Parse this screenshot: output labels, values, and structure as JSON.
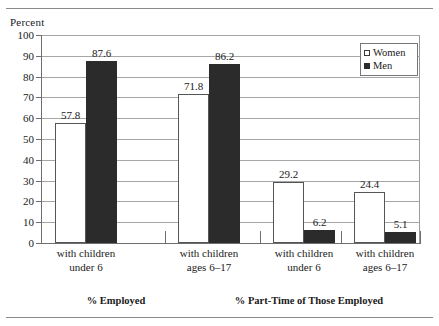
{
  "figure": {
    "axis_unit_label": "Percent",
    "rule_top": "horizontal-rule",
    "rule_bottom": "horizontal-rule"
  },
  "legend": {
    "position": "top-right",
    "entries": [
      {
        "label": "Women",
        "swatch": "open-square-white",
        "color": "#ffffff"
      },
      {
        "label": "Men",
        "swatch": "filled-square-black",
        "color": "#2b2b2b"
      }
    ]
  },
  "axis": {
    "y_ticks": [
      "100",
      "90",
      "80",
      "70",
      "60",
      "50",
      "40",
      "30",
      "20",
      "10",
      "0"
    ]
  },
  "categories": [
    {
      "line1": "with children",
      "line2": "under 6"
    },
    {
      "line1": "with children",
      "line2": "ages 6–17"
    },
    {
      "line1": "with children",
      "line2": "under 6"
    },
    {
      "line1": "with children",
      "line2": "ages 6–17"
    }
  ],
  "supergroups": [
    {
      "label": "% Employed"
    },
    {
      "label": "% Part-Time of Those Employed"
    }
  ],
  "bars": [
    {
      "group": 0,
      "series": "Women",
      "value": 57.8,
      "label": "57.8"
    },
    {
      "group": 0,
      "series": "Men",
      "value": 87.6,
      "label": "87.6"
    },
    {
      "group": 1,
      "series": "Women",
      "value": 71.8,
      "label": "71.8"
    },
    {
      "group": 1,
      "series": "Men",
      "value": 86.2,
      "label": "86.2"
    },
    {
      "group": 2,
      "series": "Women",
      "value": 29.2,
      "label": "29.2"
    },
    {
      "group": 2,
      "series": "Men",
      "value": 6.2,
      "label": "6.2"
    },
    {
      "group": 3,
      "series": "Women",
      "value": 24.4,
      "label": "24.4"
    },
    {
      "group": 3,
      "series": "Men",
      "value": 5.1,
      "label": "5.1"
    }
  ],
  "chart_data": {
    "type": "bar",
    "title": "",
    "subtitle": "",
    "xlabel": "",
    "ylabel": "Percent",
    "ylim": [
      0,
      100
    ],
    "ytick_step": 10,
    "yticks": [
      0,
      10,
      20,
      30,
      40,
      50,
      60,
      70,
      80,
      90,
      100
    ],
    "grid": "horizontal",
    "legend_position": "top-right",
    "categories": [
      "with children under 6",
      "with children ages 6–17",
      "with children under 6",
      "with children ages 6–17"
    ],
    "group_labels": [
      "% Employed",
      "% Part-Time of Those Employed"
    ],
    "group_spans": [
      [
        0,
        1
      ],
      [
        2,
        3
      ]
    ],
    "series": [
      {
        "name": "Women",
        "color": "#ffffff",
        "values": [
          57.8,
          71.8,
          29.2,
          24.4
        ]
      },
      {
        "name": "Men",
        "color": "#2b2b2b",
        "values": [
          87.6,
          86.2,
          6.2,
          5.1
        ]
      }
    ],
    "data_labels": [
      "57.8",
      "87.6",
      "71.8",
      "86.2",
      "29.2",
      "6.2",
      "24.4",
      "5.1"
    ],
    "annotations": []
  }
}
